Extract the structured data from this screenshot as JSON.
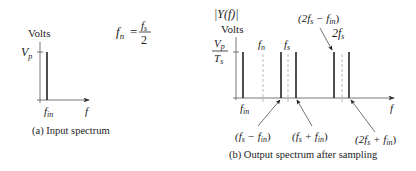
{
  "formula": {
    "lhs": "f",
    "lhs_sub": "n",
    "eq": "=",
    "num": "f",
    "num_sub": "s",
    "den": "2"
  },
  "panel_a": {
    "ylabel": "Volts",
    "ytick": "V",
    "ytick_sub": "p",
    "xtick": "f",
    "xtick_sub": "in",
    "xaxis": "f",
    "caption": "(a) Input spectrum"
  },
  "panel_b": {
    "ylabel_top": "|Y(f)|",
    "ylabel": "Volts",
    "ytick_num": "V",
    "ytick_num_sub": "p",
    "ytick_den": "T",
    "ytick_den_sub": "s",
    "xtick": "f",
    "xtick_sub": "in",
    "xaxis": "f",
    "marker_fn": "f",
    "marker_fn_sub": "n",
    "marker_fs": "f",
    "marker_fs_sub": "s",
    "marker_2fs": "2f",
    "marker_2fs_sub": "s",
    "ann_fs_minus": "(f",
    "ann_fs_minus_sub": "s",
    "ann_fs_minus_rest": " − f",
    "ann_fs_minus_sub2": "in",
    "ann_fs_plus": "(f",
    "ann_fs_plus_sub": "s",
    "ann_fs_plus_rest": " + f",
    "ann_fs_plus_sub2": "in",
    "ann_2fs_minus": "(2f",
    "ann_2fs_minus_sub": "s",
    "ann_2fs_minus_rest": " − f",
    "ann_2fs_minus_sub2": "in",
    "ann_2fs_plus": "(2f",
    "ann_2fs_plus_sub": "s",
    "ann_2fs_plus_rest": " + f",
    "ann_2fs_plus_sub2": "in",
    "close_paren": ")",
    "caption": "(b) Output spectrum after sampling"
  },
  "colors": {
    "line": "#222222",
    "axis": "#555555",
    "dashed": "#aaaaaa"
  }
}
